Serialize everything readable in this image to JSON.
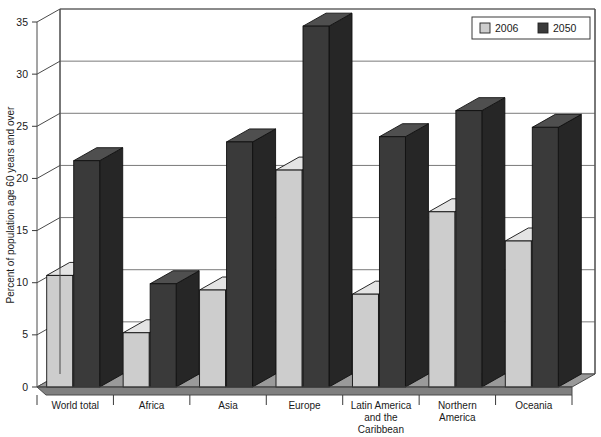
{
  "chart_data": {
    "type": "bar",
    "title": "",
    "subtitle": "",
    "xlabel": "",
    "ylabel": "Percent of population age 60 years and over",
    "ylim": [
      0,
      35
    ],
    "ytick_step": 5,
    "yticks": [
      "0",
      "5",
      "10",
      "15",
      "20",
      "25",
      "30",
      "35"
    ],
    "grid": true,
    "three_d": true,
    "legend_position": "top-right",
    "categories": [
      "World total",
      "Africa",
      "Asia",
      "Europe",
      "Latin America and the Caribbean",
      "Northern America",
      "Oceania"
    ],
    "category_labels_wrapped": [
      [
        "World total"
      ],
      [
        "Africa"
      ],
      [
        "Asia"
      ],
      [
        "Europe"
      ],
      [
        "Latin America",
        "and the",
        "Caribbean"
      ],
      [
        "Northern",
        "America"
      ],
      [
        "Oceania"
      ]
    ],
    "series": [
      {
        "name": "2006",
        "color": "#cdcdcd",
        "values": [
          10.7,
          5.2,
          9.3,
          20.8,
          8.9,
          16.8,
          14.0
        ]
      },
      {
        "name": "2050",
        "color": "#3a3a3a",
        "values": [
          21.7,
          9.9,
          23.5,
          34.6,
          24.0,
          26.5,
          24.9
        ]
      }
    ]
  },
  "legend": {
    "entries": [
      {
        "label": "2006",
        "swatch_color": "#cdcdcd"
      },
      {
        "label": "2050",
        "swatch_color": "#3a3a3a"
      }
    ]
  },
  "colors": {
    "series_2006_face": "#cdcdcd",
    "series_2006_top": "#e4e4e4",
    "series_2006_side": "#a8a8a8",
    "series_2050_face": "#3a3a3a",
    "series_2050_top": "#4f4f4f",
    "series_2050_side": "#262626",
    "floor": "#9a9a9a",
    "floor_front": "#808080",
    "background": "#ffffff",
    "gridline": "#6b6b6b",
    "axis": "#4a4a4a"
  }
}
